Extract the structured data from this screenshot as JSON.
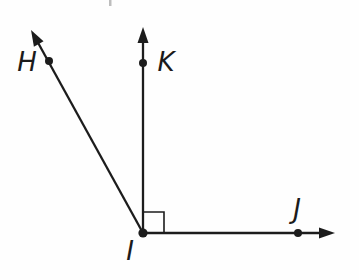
{
  "figure": {
    "canvas": {
      "width": 359,
      "height": 280
    },
    "colors": {
      "background": "#fefefe",
      "ink": "#1c1c1c",
      "artifact": "#bdbdbd"
    },
    "points": [
      {
        "id": "H",
        "label": "H",
        "x": 49,
        "y": 61,
        "dot_radius": 4,
        "label_x": 27,
        "label_y": 71
      },
      {
        "id": "K",
        "label": "K",
        "x": 143,
        "y": 63,
        "dot_radius": 4,
        "label_x": 166,
        "label_y": 71
      },
      {
        "id": "I",
        "label": "I",
        "x": 143,
        "y": 233,
        "dot_radius": 4.6,
        "label_x": 130,
        "label_y": 260
      },
      {
        "id": "J",
        "label": "J",
        "x": 298,
        "y": 233,
        "dot_radius": 4,
        "label_x": 297,
        "label_y": 218
      }
    ],
    "rays": [
      {
        "id": "ray-IH",
        "from": "I",
        "through": "H",
        "tip_x": 31,
        "tip_y": 30
      },
      {
        "id": "ray-IK",
        "from": "I",
        "through": "K",
        "tip_x": 143,
        "tip_y": 27
      },
      {
        "id": "ray-IJ",
        "from": "I",
        "through": "J",
        "tip_x": 335,
        "tip_y": 233
      }
    ],
    "right_angle_marker": {
      "at": "I",
      "size": 21,
      "between": [
        "ray-IK",
        "ray-IJ"
      ]
    },
    "style": {
      "line_width": 2.3,
      "marker_line_width": 1.6,
      "arrow_length": 16,
      "arrow_half_width": 5.5,
      "label_font_size": 26
    },
    "artifacts": [
      {
        "id": "top-tick",
        "x": 109,
        "y": 0,
        "width": 2.5,
        "height": 6
      }
    ]
  }
}
